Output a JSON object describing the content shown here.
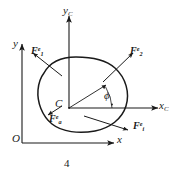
{
  "figure": {
    "caption": "4",
    "type": "free-body-diagram"
  },
  "global_frame": {
    "origin_label": "O",
    "x_axis_label": "x",
    "y_axis_label": "y"
  },
  "body_frame": {
    "origin_label": "C",
    "x_axis_label": "x",
    "x_axis_sub": "C",
    "y_axis_label": "y",
    "y_axis_sub": "C",
    "angle_label": "ϕ"
  },
  "forces": [
    {
      "id": "f1-upper-left",
      "base": "F",
      "sub": "1",
      "sup": "e"
    },
    {
      "id": "f2-upper-right",
      "base": "F",
      "sub": "2",
      "sup": "e"
    },
    {
      "id": "fa-lower-left",
      "base": "F",
      "sub": "a",
      "sup": "e"
    },
    {
      "id": "fi-lower-right",
      "base": "F",
      "sub": "i",
      "sup": "e"
    }
  ],
  "colors": {
    "ink": "#1a1a1a",
    "background": "#ffffff"
  }
}
